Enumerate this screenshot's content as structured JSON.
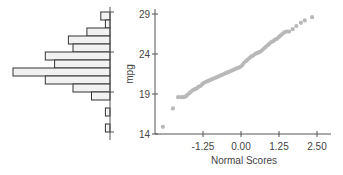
{
  "chart_data": [
    {
      "type": "bar",
      "orientation": "horizontal",
      "title": "",
      "description": "Histogram of mpg (bars extend leftward from the axis)",
      "bins": [
        {
          "index": 0,
          "count": 2
        },
        {
          "index": 1,
          "count": 1
        },
        {
          "index": 2,
          "count": 5
        },
        {
          "index": 3,
          "count": 9
        },
        {
          "index": 4,
          "count": 8
        },
        {
          "index": 5,
          "count": 14
        },
        {
          "index": 6,
          "count": 12
        },
        {
          "index": 7,
          "count": 21
        },
        {
          "index": 8,
          "count": 14
        },
        {
          "index": 9,
          "count": 8
        },
        {
          "index": 10,
          "count": 4
        },
        {
          "index": 11,
          "count": 0
        },
        {
          "index": 12,
          "count": 1
        },
        {
          "index": 13,
          "count": 0
        },
        {
          "index": 14,
          "count": 1
        }
      ],
      "ylim": [
        14,
        29
      ],
      "grid": false
    },
    {
      "type": "scatter",
      "title": "",
      "xlabel": "Normal Scores",
      "ylabel": "mpg",
      "xticks": [
        "-1.25",
        "0.00",
        "1.25",
        "2.50"
      ],
      "yticks": [
        "14",
        "19",
        "24",
        "29"
      ],
      "xlim": [
        -2.9,
        2.9
      ],
      "ylim": [
        14,
        29.5
      ],
      "grid": false,
      "legend": null,
      "points": [
        [
          -2.57,
          14.9
        ],
        [
          -2.24,
          17.2
        ],
        [
          -2.07,
          18.6
        ],
        [
          -1.97,
          18.6
        ],
        [
          -1.89,
          18.6
        ],
        [
          -1.82,
          18.7
        ],
        [
          -1.76,
          18.9
        ],
        [
          -1.7,
          19.1
        ],
        [
          -1.64,
          19.3
        ],
        [
          -1.58,
          19.5
        ],
        [
          -1.52,
          19.6
        ],
        [
          -1.46,
          19.7
        ],
        [
          -1.4,
          19.9
        ],
        [
          -1.34,
          20.0
        ],
        [
          -1.28,
          20.2
        ],
        [
          -1.22,
          20.4
        ],
        [
          -1.16,
          20.5
        ],
        [
          -1.1,
          20.6
        ],
        [
          -1.04,
          20.7
        ],
        [
          -0.98,
          20.8
        ],
        [
          -0.92,
          20.9
        ],
        [
          -0.86,
          21.0
        ],
        [
          -0.8,
          21.1
        ],
        [
          -0.74,
          21.2
        ],
        [
          -0.68,
          21.3
        ],
        [
          -0.62,
          21.4
        ],
        [
          -0.56,
          21.5
        ],
        [
          -0.5,
          21.6
        ],
        [
          -0.44,
          21.7
        ],
        [
          -0.38,
          21.8
        ],
        [
          -0.32,
          21.9
        ],
        [
          -0.26,
          22.0
        ],
        [
          -0.2,
          22.1
        ],
        [
          -0.14,
          22.2
        ],
        [
          -0.08,
          22.3
        ],
        [
          -0.02,
          22.4
        ],
        [
          0.04,
          22.6
        ],
        [
          0.1,
          22.9
        ],
        [
          0.16,
          23.1
        ],
        [
          0.22,
          23.3
        ],
        [
          0.28,
          23.5
        ],
        [
          0.34,
          23.7
        ],
        [
          0.4,
          23.8
        ],
        [
          0.46,
          24.0
        ],
        [
          0.52,
          24.1
        ],
        [
          0.58,
          24.2
        ],
        [
          0.64,
          24.3
        ],
        [
          0.7,
          24.5
        ],
        [
          0.76,
          24.7
        ],
        [
          0.82,
          24.9
        ],
        [
          0.88,
          25.1
        ],
        [
          0.94,
          25.3
        ],
        [
          1.0,
          25.5
        ],
        [
          1.06,
          25.6
        ],
        [
          1.12,
          25.8
        ],
        [
          1.18,
          25.9
        ],
        [
          1.24,
          26.1
        ],
        [
          1.3,
          26.3
        ],
        [
          1.36,
          26.5
        ],
        [
          1.42,
          26.7
        ],
        [
          1.5,
          26.8
        ],
        [
          1.58,
          26.8
        ],
        [
          1.7,
          27.1
        ],
        [
          1.82,
          27.5
        ],
        [
          1.97,
          27.9
        ],
        [
          2.1,
          28.2
        ],
        [
          2.34,
          28.6
        ]
      ]
    }
  ],
  "labels": {
    "ylabel": "mpg",
    "xlabel": "Normal Scores",
    "yticks": [
      "29",
      "24",
      "19",
      "14"
    ],
    "xticks": [
      "-1.25",
      "0.00",
      "1.25",
      "2.50"
    ]
  },
  "colors": {
    "axis": "#555555",
    "bar_fill": "#f2f2f2",
    "bar_stroke": "#333333",
    "point": "#b8b8b8",
    "text": "#444444"
  }
}
